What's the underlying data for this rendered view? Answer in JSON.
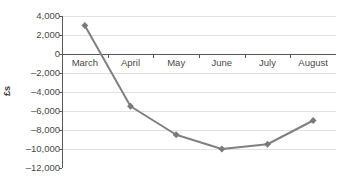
{
  "chart_data": {
    "type": "line",
    "title": "",
    "subtitle": "",
    "xlabel": "",
    "ylabel": "£s",
    "categories": [
      "March",
      "April",
      "May",
      "June",
      "July",
      "August"
    ],
    "series": [
      {
        "name": "",
        "values": [
          3000,
          -5500,
          -8500,
          -10000,
          -9500,
          -7000
        ]
      }
    ],
    "ylim": [
      -12000,
      4000
    ],
    "y_ticks": [
      4000,
      2000,
      0,
      -2000,
      -4000,
      -6000,
      -8000,
      -10000,
      -12000
    ],
    "y_tick_labels": [
      "4,000",
      "2,000",
      "0",
      "–2,000",
      "–4,000",
      "–6,000",
      "–8,000",
      "–10,000",
      "–12,000"
    ],
    "grid": true,
    "grid_axis": "y",
    "legend": false,
    "legend_position": "none",
    "marker": "diamond",
    "x_labels_position": "below-zero-line",
    "colors": {
      "line": "#808080",
      "marker": "#7a7a7a",
      "gridline": "#e2e2e2",
      "zero_line": "#595959",
      "axis_spine": "#595959",
      "tick_text": "#4a4a4a",
      "axis_title": "#3a3a3a",
      "background": "#ffffff"
    }
  }
}
